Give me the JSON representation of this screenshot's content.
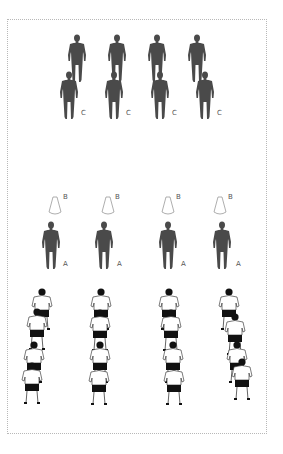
{
  "diagram": {
    "type": "football drill setup",
    "colors": {
      "player_silhouette": "#4a4a4a",
      "cone_outline": "#999999",
      "border": "#b8b8b8",
      "shirt": "#ffffff",
      "shorts": "#111111"
    },
    "top_group": {
      "rows": 2,
      "columns": 4,
      "front_row_label": "C",
      "labels": [
        "C",
        "C",
        "C",
        "C"
      ]
    },
    "middle_group": {
      "cone_label": "B",
      "player_label": "A",
      "columns": [
        {
          "cone": "B",
          "player": "A"
        },
        {
          "cone": "B",
          "player": "A"
        },
        {
          "cone": "B",
          "player": "A"
        },
        {
          "cone": "B",
          "player": "A"
        }
      ]
    },
    "bottom_group": {
      "description": "queued players in white shirts and black shorts",
      "columns": 4,
      "players_per_column": 4
    }
  }
}
